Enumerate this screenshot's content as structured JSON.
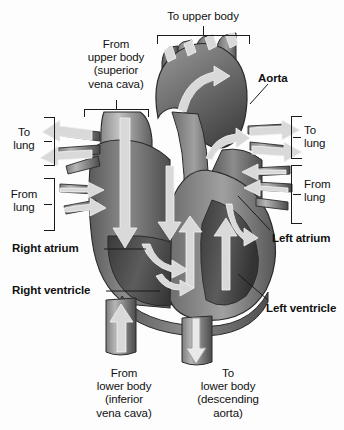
{
  "diagram": {
    "background_color": "#fdfdfd",
    "text_color": "#111111",
    "labels": {
      "to_upper_body": "To upper body",
      "from_upper_body": "From\nupper body\n(superior\nvena cava)",
      "aorta": "Aorta",
      "to_lung_left": "To\nlung",
      "from_lung_left": "From\nlung",
      "to_lung_right": "To\nlung",
      "from_lung_right": "From\nlung",
      "right_atrium": "Right atrium",
      "right_ventricle": "Right ventricle",
      "left_atrium": "Left atrium",
      "left_ventricle": "Left ventricle",
      "from_lower_body": "From\nlower body\n(inferior\nvena cava)",
      "to_lower_body": "To\nlower body\n(descending\naorta)"
    },
    "palette": {
      "ink": "#1a1a1a",
      "muscle_dark": "#4a4a4a",
      "muscle_mid": "#6f6f6f",
      "muscle_light": "#909090",
      "chamber_shadow": "#3c3c3c",
      "vessel_light": "#b8b8b8",
      "arrow_fill": "#d6d6d6",
      "arrow_stroke": "#f2f2f2",
      "outline": "#2a2a2a"
    }
  }
}
